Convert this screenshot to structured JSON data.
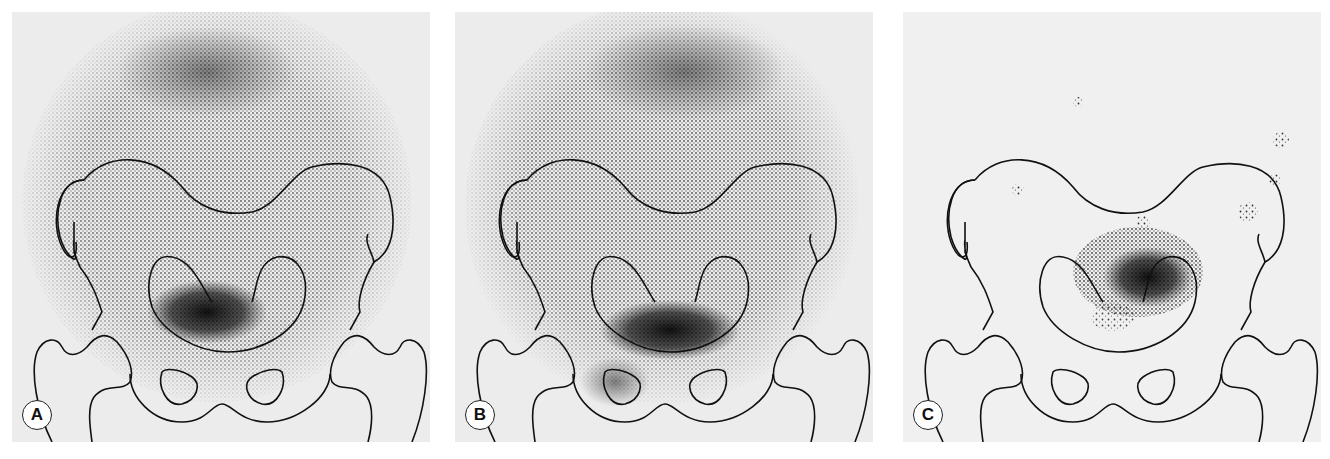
{
  "figure": {
    "panels": [
      {
        "id": "A",
        "label": "A",
        "description": "Diffuse activity over pelvis with dense focus above pubic region"
      },
      {
        "id": "B",
        "label": "B",
        "description": "Diffuse activity over pelvis, denser, with dense focus above pubic region"
      },
      {
        "id": "C",
        "label": "C",
        "description": "Sparse background with focal activity in lower pelvis"
      }
    ],
    "colors": {
      "background": "#ececec",
      "outline": "#111111",
      "activity": "#2a2a2a"
    }
  }
}
